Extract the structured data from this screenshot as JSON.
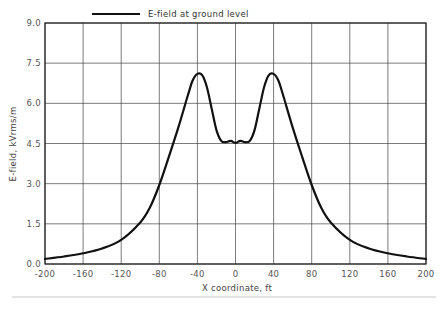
{
  "chart_data": {
    "type": "line",
    "title": "",
    "xlabel": "X coordinate, ft",
    "ylabel": "E-field, kVrms/m",
    "xlim": [
      -200,
      200
    ],
    "ylim": [
      0,
      9.0
    ],
    "xticks": [
      -200,
      -160,
      -120,
      -80,
      -40,
      0,
      40,
      80,
      120,
      160,
      200
    ],
    "yticks": [
      0.0,
      1.5,
      3.0,
      4.5,
      6.0,
      7.5,
      9.0
    ],
    "xtick_labels": [
      "-200",
      "-160",
      "-120",
      "-80",
      "-40",
      "0",
      "40",
      "80",
      "120",
      "160",
      "200"
    ],
    "ytick_labels": [
      "0.0",
      "1.5",
      "3.0",
      "4.5",
      "6.0",
      "7.5",
      "9.0"
    ],
    "grid": true,
    "legend_position": "top",
    "series": [
      {
        "name": "E-field at ground level",
        "color": "#111111",
        "x": [
          -200,
          -180,
          -160,
          -140,
          -120,
          -100,
          -90,
          -80,
          -70,
          -60,
          -50,
          -45,
          -40,
          -35,
          -30,
          -25,
          -20,
          -15,
          -10,
          -5,
          0,
          5,
          10,
          15,
          20,
          25,
          30,
          35,
          40,
          45,
          50,
          60,
          70,
          80,
          90,
          100,
          120,
          140,
          160,
          180,
          200
        ],
        "y": [
          0.19,
          0.28,
          0.4,
          0.58,
          0.9,
          1.55,
          2.1,
          2.95,
          4.0,
          5.1,
          6.3,
          6.85,
          7.1,
          7.05,
          6.6,
          5.8,
          5.0,
          4.6,
          4.55,
          4.6,
          4.52,
          4.6,
          4.55,
          4.6,
          5.0,
          5.8,
          6.6,
          7.05,
          7.1,
          6.85,
          6.3,
          5.1,
          4.0,
          2.95,
          2.1,
          1.55,
          0.9,
          0.58,
          0.4,
          0.28,
          0.19
        ]
      }
    ]
  },
  "legend": {
    "label": "E-field at ground level"
  },
  "axes": {
    "xlabel": "X coordinate, ft",
    "ylabel": "E-field, kVrms/m"
  }
}
